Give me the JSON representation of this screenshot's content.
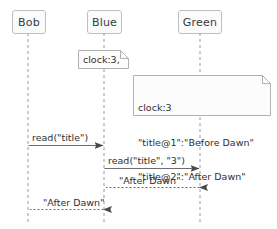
{
  "diagram": {
    "type": "sequence-diagram",
    "background_color": "#ffffff",
    "line_color": "#8c8c8c",
    "text_color": "#2f2f2f",
    "box_fill": "#fbfbfb",
    "box_border": "#bfbfbf"
  },
  "participants": [
    {
      "label": "Bob",
      "lifeline_x": 28
    },
    {
      "label": "Blue",
      "lifeline_x": 104
    },
    {
      "label": "Green",
      "lifeline_x": 200
    }
  ],
  "notes": [
    {
      "id": "note-clock-blue",
      "attached_to": "Blue",
      "lines": [
        "clock:3,"
      ]
    },
    {
      "id": "note-clock-green",
      "attached_to": "Green",
      "lines": [
        "clock:3",
        "\"title@1\":\"Before Dawn\"",
        "\"title@2\":\"After Dawn\""
      ]
    }
  ],
  "messages": [
    {
      "label": "read(\"title\")",
      "from": "Bob",
      "to": "Blue",
      "direction": "right",
      "style": "solid"
    },
    {
      "label": "read(\"title\", \"3\")",
      "from": "Blue",
      "to": "Green",
      "direction": "right",
      "style": "solid"
    },
    {
      "label": "\"After Dawn\"",
      "from": "Green",
      "to": "Blue",
      "direction": "left",
      "style": "dashed"
    },
    {
      "label": "\"After Dawn\"",
      "from": "Blue",
      "to": "Bob",
      "direction": "left",
      "style": "dashed"
    }
  ]
}
